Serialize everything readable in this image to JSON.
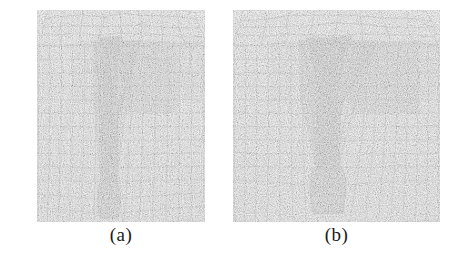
{
  "figure": {
    "name": "finite-element-mesh-comparison",
    "background_color": "#ffffff",
    "width": 465,
    "height": 268,
    "panels": [
      {
        "id": "a",
        "caption": "(a)",
        "x": 37,
        "y": 10,
        "width": 168,
        "height": 212,
        "description": "Finite element mesh of a narrow crack / notch cross-section with perspective top surface",
        "crack": {
          "top_width": 26,
          "mid_width": 13,
          "root_width": 22,
          "center_x": 72,
          "root_y": 175,
          "tip_y": 207,
          "right_flank_slant": 18
        },
        "shading": {
          "body": "#d9d9d9",
          "mid_band": "#b9b9b9",
          "dark_band": "#9a9a9a",
          "crack_core": "#6f6f6f",
          "crack_core_dark": "#545454",
          "top_face": "#e2e2e2",
          "line": "#3a3a3a",
          "line_soft": "#6a6a6a"
        },
        "mesh": {
          "vertical_columns_left": 5,
          "vertical_columns_right": 6,
          "horizontal_rows": 13,
          "top_perspective_rows": 3,
          "root_refinement_rows": 5
        }
      },
      {
        "id": "b",
        "caption": "(b)",
        "x": 233,
        "y": 10,
        "width": 207,
        "height": 212,
        "description": "Finite element mesh of a wider funnel-shaped crack / notch with bulbous root region",
        "crack": {
          "top_width": 52,
          "mid_width": 20,
          "root_width": 36,
          "center_x": 95,
          "root_y": 160,
          "tip_y": 202,
          "right_flank_slant": 24
        },
        "shading": {
          "body": "#d9d9d9",
          "mid_band": "#b6b6b6",
          "dark_band": "#979797",
          "crack_core": "#6b6b6b",
          "crack_core_dark": "#4f4f4f",
          "top_face": "#e2e2e2",
          "line": "#3a3a3a",
          "line_soft": "#6a6a6a"
        },
        "mesh": {
          "vertical_columns_left": 6,
          "vertical_columns_right": 7,
          "horizontal_rows": 13,
          "top_perspective_rows": 3,
          "root_refinement_rows": 5
        }
      }
    ]
  },
  "chart_data": {
    "type": "diagram",
    "title": "",
    "subtitle": "",
    "xlabel": "",
    "ylabel": "",
    "legend": [],
    "annotations": [
      "(a)",
      "(b)"
    ]
  }
}
